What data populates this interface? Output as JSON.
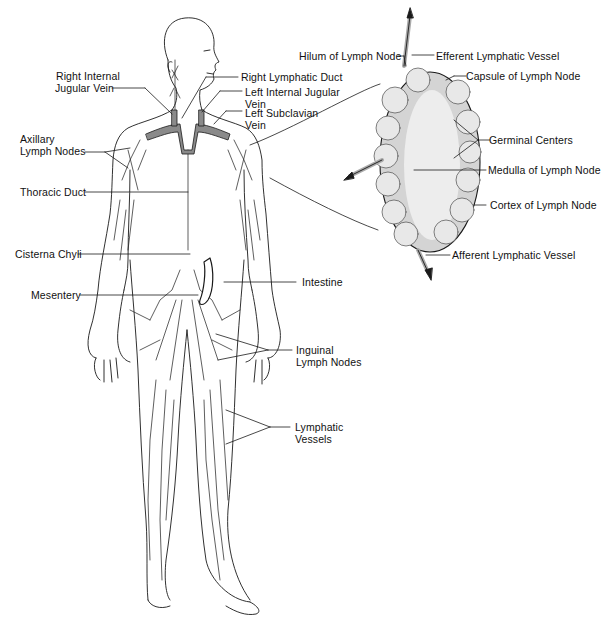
{
  "diagram": {
    "body_labels": {
      "right_internal_jugular_vein": [
        "Right Internal",
        "Jugular Vein"
      ],
      "right_lymphatic_duct": "Right Lymphatic Duct",
      "left_internal_jugular_vein": [
        "Left Internal Jugular",
        "Vein"
      ],
      "left_subclavian_vein": [
        "Left Subclavian",
        "Vein"
      ],
      "axillary_lymph_nodes": [
        "Axillary",
        "Lymph Nodes"
      ],
      "thoracic_duct": "Thoracic Duct",
      "cisterna_chyli": "Cisterna Chyli",
      "intestine": "Intestine",
      "mesentery": "Mesentery",
      "inguinal_lymph_nodes": [
        "Inguinal",
        "Lymph Nodes"
      ],
      "lymphatic_vessels": [
        "Lymphatic",
        "Vessels"
      ]
    },
    "node_labels": {
      "hilum": "Hilum of Lymph Node",
      "efferent": "Efferent Lymphatic Vessel",
      "capsule": "Capsule of Lymph Node",
      "germinal_centers": "Germinal Centers",
      "medulla": "Medulla of Lymph Node",
      "cortex": "Cortex of Lymph Node",
      "afferent": "Afferent Lymphatic Vessel"
    },
    "colors": {
      "ink": "#1a1a1a",
      "duct_fill": "#8a8a8a",
      "node_fill": "#d9d9d9",
      "node_medulla": "#ececec",
      "background": "#ffffff"
    }
  }
}
